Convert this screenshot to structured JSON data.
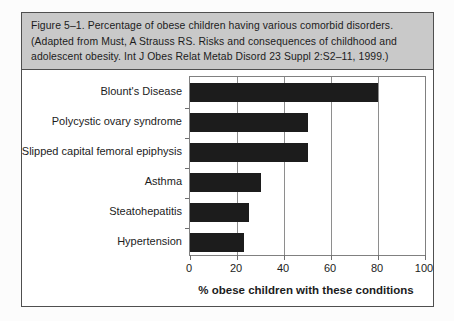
{
  "figure": {
    "caption_lines": [
      "Figure 5–1. Percentage of obese children having various comorbid disorders.",
      "(Adapted from Must, A Strauss RS. Risks and consequences of childhood and",
      "adolescent obesity. Int J Obes Relat Metab Disord 23 Suppl 2:S2–11, 1999.)"
    ]
  },
  "colors": {
    "page_bg": "#fcfcfc",
    "caption_bg": "#c9c9c9",
    "box_border": "#4f4f4f",
    "plot_border": "#808080",
    "gridline": "#8e8e8e",
    "tick": "#6e6e6e",
    "bar": "#1c1c1c",
    "text": "#1c1c1c"
  },
  "chart_data": {
    "type": "bar",
    "orientation": "horizontal",
    "title": "Percentage of obese children having various comorbid disorders",
    "categories": [
      "Blount's Disease",
      "Polycystic ovary syndrome",
      "Slipped capital femoral epiphysis",
      "Asthma",
      "Steatohepatitis",
      "Hypertension"
    ],
    "values": [
      80,
      50,
      50,
      30,
      25,
      23
    ],
    "xlabel": "% obese children with these conditions",
    "ylabel": "",
    "xlim": [
      0,
      100
    ],
    "xticks": [
      0,
      20,
      40,
      60,
      80,
      100
    ],
    "grid": true,
    "legend": false,
    "bar_color": "#1c1c1c"
  }
}
